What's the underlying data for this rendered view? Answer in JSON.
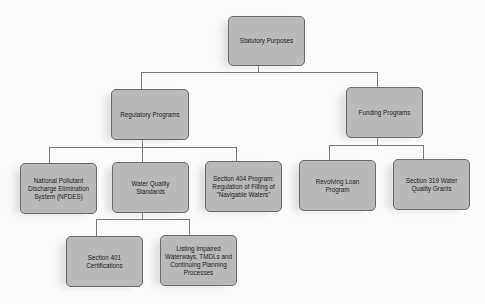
{
  "diagram": {
    "root": {
      "label": "Statutory Purposes"
    },
    "level2": [
      {
        "label": "Regulatory Programs"
      },
      {
        "label": "Funding Programs"
      }
    ],
    "regulatory_children": [
      {
        "label": "National Pollutant Discharge Elimination System (NPDES)"
      },
      {
        "label": "Water Quality Standards"
      },
      {
        "label": "Section 404 Program: Regulation of Filling of \"Navigable Waters\""
      }
    ],
    "funding_children": [
      {
        "label": "Revolving Loan Program"
      },
      {
        "label": "Section 319 Water Quality Grants"
      }
    ],
    "wqs_children": [
      {
        "label": "Section 401 Certifications"
      },
      {
        "label": "Listing Impaired Waterways, TMDLs and Continuing Planning Processes"
      }
    ],
    "colors": {
      "box_fill": "#b9b9b9",
      "box_border": "#6a6a6a",
      "connector": "#7a7a7a",
      "background": "#fbfbfb"
    }
  }
}
